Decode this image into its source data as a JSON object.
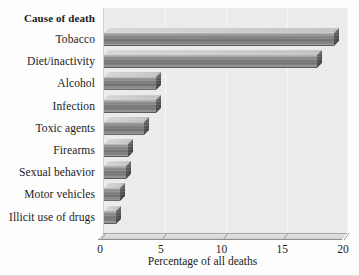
{
  "chart_data": {
    "type": "bar",
    "orientation": "horizontal",
    "title": "",
    "header_label": "Cause of death",
    "xlabel": "Percentage of all deaths",
    "ylabel": "",
    "xlim": [
      0,
      20
    ],
    "xticks": [
      0,
      5,
      10,
      15,
      20
    ],
    "xtick_labels": [
      "0",
      "5",
      "10",
      "15",
      "20"
    ],
    "grid": true,
    "grid_axis": "x",
    "legend": "none",
    "categories": [
      "Tobacco",
      "Diet/inactivity",
      "Alcohol",
      "Infection",
      "Toxic agents",
      "Firearms",
      "Sexual behavior",
      "Motor vehicles",
      "Illicit use of drugs"
    ],
    "values": [
      18.9,
      17.5,
      4.3,
      4.3,
      3.3,
      2.0,
      1.8,
      1.3,
      1.0
    ],
    "bars": [
      {
        "label": "Tobacco",
        "value": 18.9
      },
      {
        "label": "Diet/inactivity",
        "value": 17.5
      },
      {
        "label": "Alcohol",
        "value": 4.3
      },
      {
        "label": "Infection",
        "value": 4.3
      },
      {
        "label": "Toxic agents",
        "value": 3.3
      },
      {
        "label": "Firearms",
        "value": 2.0
      },
      {
        "label": "Sexual behavior",
        "value": 1.8
      },
      {
        "label": "Motor vehicles",
        "value": 1.3
      },
      {
        "label": "Illicit use of drugs",
        "value": 1.0
      }
    ],
    "colors": {
      "plot_background": "#ebebeb",
      "gridline": "#f7f7f7",
      "bar_face": "#7c7c7c",
      "bar_top": "#c9c9c9",
      "bar_side": "#555555",
      "text": "#1b1b1b",
      "page_background": "#fdfdfd"
    }
  }
}
